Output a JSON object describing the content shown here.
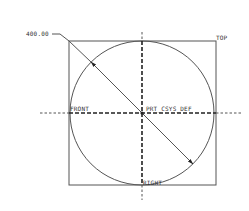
{
  "drawing": {
    "dimension": {
      "value_label": "400.00",
      "kind": "diameter"
    },
    "datum_planes": {
      "top": "TOP",
      "front": "FRONT",
      "right": "RIGHT"
    },
    "coordinate_system": "PRT_CSYS_DEF",
    "colors": {
      "background": "#ffffff",
      "geometry": "#555555",
      "datum": "#222222",
      "text": "#333333"
    }
  }
}
